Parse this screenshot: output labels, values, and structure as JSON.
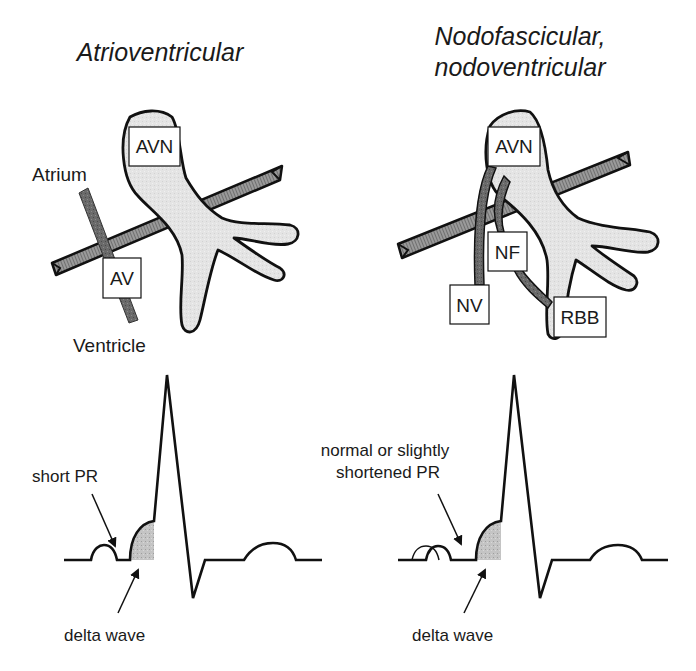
{
  "panels": [
    {
      "id": "atrioventricular",
      "title_lines": [
        "Atrioventricular"
      ],
      "node_labels": {
        "avn": "AVN",
        "pathway": "AV"
      },
      "side_labels": {
        "top": "Atrium",
        "bottom": "Ventricle"
      },
      "ecg_labels": {
        "pr": "short PR",
        "delta": "delta wave"
      }
    },
    {
      "id": "nodofascicular-nodoventricular",
      "title_lines": [
        "Nodofascicular,",
        "nodoventricular"
      ],
      "node_labels": {
        "avn": "AVN",
        "nf": "NF",
        "nv": "NV",
        "rbb": "RBB"
      },
      "ecg_labels": {
        "pr_lines": [
          "normal or slightly",
          "shortened PR"
        ],
        "delta": "delta wave"
      }
    }
  ],
  "colors": {
    "outline": "#111111",
    "node_fill": "#e6e6e6",
    "band_fill": "#8a8a8a",
    "pathway_fill": "#6e6e6e",
    "delta_fill": "#bdbdbd",
    "box_fill": "#ffffff"
  }
}
